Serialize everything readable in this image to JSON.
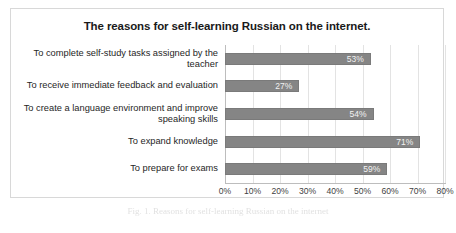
{
  "chart_data": {
    "type": "bar",
    "orientation": "horizontal",
    "title": "The reasons for self-learning Russian on the internet.",
    "xlabel": "",
    "ylabel": "",
    "xlim": [
      0,
      80
    ],
    "xtick_labels": [
      "0%",
      "10%",
      "20%",
      "30%",
      "40%",
      "50%",
      "60%",
      "70%",
      "80%"
    ],
    "xtick_values": [
      0,
      10,
      20,
      30,
      40,
      50,
      60,
      70,
      80
    ],
    "grid": true,
    "legend": false,
    "bar_color": "#858585",
    "categories": [
      "To complete self-study tasks assigned by the teacher",
      "To receive immediate feedback and evaluation",
      "To create a language environment and improve speaking skills",
      "To expand knowledge",
      "To prepare for exams"
    ],
    "values": [
      53,
      27,
      54,
      71,
      59
    ],
    "value_labels": [
      "53%",
      "27%",
      "54%",
      "71%",
      "59%"
    ]
  },
  "caption": {
    "text": "Fig. 1. Reasons for self-learning Russian on the internet"
  }
}
